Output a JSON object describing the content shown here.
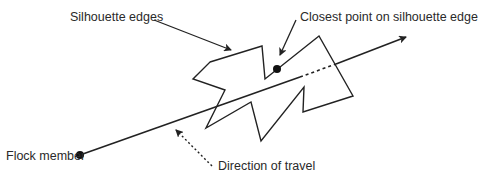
{
  "diagram": {
    "labels": {
      "silhouette_edges": "Silhouette edges",
      "closest_point": "Closest point on silhouette edge",
      "flock_member": "Flock member",
      "direction_of_travel": "Direction of travel"
    },
    "colors": {
      "stroke": "#222222",
      "text": "#2a2a2a",
      "background": "#ffffff"
    }
  }
}
